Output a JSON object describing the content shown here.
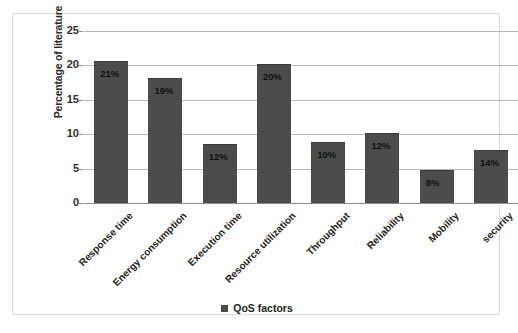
{
  "chart_data": {
    "type": "bar",
    "title": "",
    "xlabel": "",
    "ylabel": "Percentage of literature",
    "ylim": [
      0,
      25
    ],
    "yticks": [
      0,
      5,
      10,
      15,
      20,
      25
    ],
    "ytick_labels": [
      "0",
      "5",
      "10",
      "15",
      "20",
      "25"
    ],
    "grid": true,
    "legend_position": "bottom",
    "legend_entries": [
      "QoS factors"
    ],
    "categories": [
      "Response time",
      "Energy consumption",
      "Execution time",
      "Resource utilization",
      "Throughput",
      "Reliability",
      "Mobility",
      "security"
    ],
    "series": [
      {
        "name": "QoS factors",
        "values": [
          20.5,
          18.0,
          8.5,
          20.0,
          8.7,
          10.0,
          4.7,
          7.5
        ],
        "color": "#4b4b4b"
      }
    ],
    "data_labels": [
      "21%",
      "19%",
      "12%",
      "20%",
      "10%",
      "12%",
      "8%",
      "14%"
    ]
  },
  "legend": {
    "marker": "square-marker",
    "label": "QoS factors"
  },
  "axes": {
    "y_title": "Percentage of literature"
  },
  "colors": {
    "bar": "#4b4b4b",
    "gridline": "#b9b9b9",
    "axis": "#8d8d8d",
    "frame": "#dcdcdc",
    "text": "#232323"
  }
}
